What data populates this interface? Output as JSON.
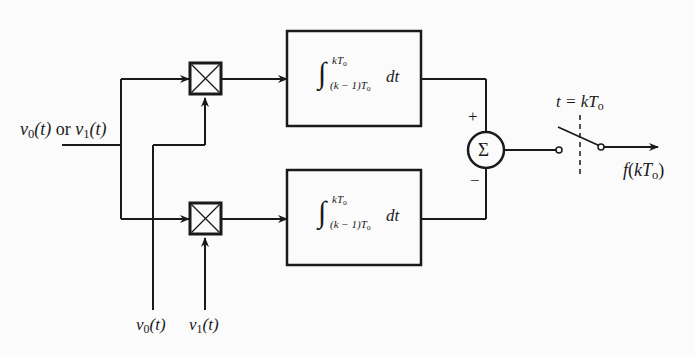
{
  "diagram": {
    "type": "correlation receiver block diagram",
    "input_label": {
      "v": "v",
      "sub0": "0",
      "t": "(t)",
      "or": " or ",
      "v2": "v",
      "sub1": "1",
      "t2": "(t)"
    },
    "reference_labels": [
      {
        "v": "v",
        "sub": "0",
        "t": "(t)"
      },
      {
        "v": "v",
        "sub": "1",
        "t": "(t)"
      }
    ],
    "multipliers": [
      {
        "name": "top-multiplier",
        "symbol": "⊠"
      },
      {
        "name": "bottom-multiplier",
        "symbol": "⊠"
      }
    ],
    "integrators": [
      {
        "upper": "kT",
        "upper_sub": "o",
        "lower": "(k − 1)T",
        "lower_sub": "o",
        "integrand": "dt"
      },
      {
        "upper": "kT",
        "upper_sub": "o",
        "lower": "(k − 1)T",
        "lower_sub": "o",
        "integrand": "dt"
      }
    ],
    "summer": {
      "symbol": "Σ",
      "plus": "+",
      "minus": "−"
    },
    "switch": {
      "label": "t = kT",
      "label_sub": "o"
    },
    "output_label": {
      "f": "f",
      "rest": "(kT",
      "sub": "o",
      "close": ")"
    },
    "colors": {
      "line": "#1a1a1a",
      "background": "#fbfbfb"
    }
  }
}
